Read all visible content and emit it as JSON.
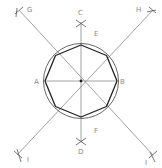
{
  "colors": {
    "background": "#ffffff",
    "construction_line": "#8a8a8a",
    "circle": "#555555",
    "octagon": "#222222",
    "label": "#8a8a8a"
  },
  "labels": {
    "A": "A",
    "B": "B",
    "C": "C",
    "D": "D",
    "E": "E",
    "F": "F",
    "G": "G",
    "H": "H",
    "I": "I",
    "J": "I"
  },
  "geometry": {
    "center": [
      81,
      81
    ],
    "circle_radius": 37,
    "octagon_radius": 36
  }
}
